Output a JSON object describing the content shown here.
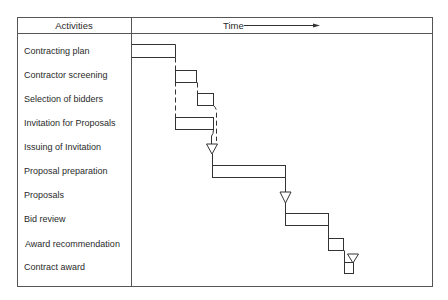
{
  "header": {
    "activities_label": "Activities",
    "time_label": "Time"
  },
  "colors": {
    "line": "#333333",
    "frame": "#555555",
    "text": "#2a2a2a",
    "background": "#ffffff"
  },
  "activities": [
    {
      "label": "Contracting plan",
      "type": "bar",
      "x0": 132,
      "x1": 175
    },
    {
      "label": "Contractor screening",
      "type": "bar",
      "x0": 175,
      "x1": 197
    },
    {
      "label": "Selection of bidders",
      "type": "bar",
      "x0": 197,
      "x1": 214
    },
    {
      "label": "Invitation for Proposals",
      "type": "bar",
      "x0": 175,
      "x1": 214
    },
    {
      "label": "Issuing of Invitation",
      "type": "milestone",
      "x": 212
    },
    {
      "label": "Proposal preparation",
      "type": "bar",
      "x0": 212,
      "x1": 285
    },
    {
      "label": "Proposals",
      "type": "milestone",
      "x": 285
    },
    {
      "label": "Bid review",
      "type": "bar",
      "x0": 285,
      "x1": 329
    },
    {
      "label": "Award recommendation",
      "type": "bar",
      "x0": 329,
      "x1": 344
    },
    {
      "label": "Contract award",
      "type": "bar+milestone",
      "x0": 344,
      "x1": 353,
      "x": 353
    }
  ]
}
